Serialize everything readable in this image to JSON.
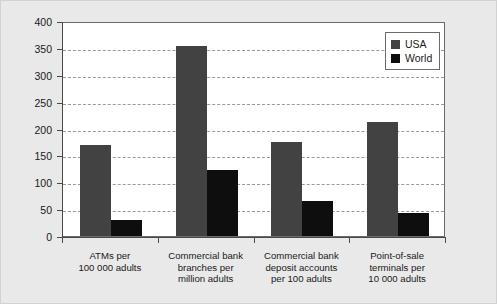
{
  "chart_data": {
    "type": "bar",
    "title": "",
    "subtitle": "",
    "xlabel": "",
    "ylabel": "",
    "ylim": [
      0,
      400
    ],
    "ytick_step": 50,
    "yticks": [
      "400",
      "350",
      "300",
      "250",
      "200",
      "150",
      "100",
      "50",
      "0"
    ],
    "grid": true,
    "grid_style": "dashed-horizontal",
    "legend_position": "top-right-inside",
    "categories": [
      "ATMs per\n100 000 adults",
      "Commercial bank\nbranches per\nmillion adults",
      "Commercial bank\ndeposit accounts\nper 100 adults",
      "Point-of-sale\nterminals per\n10 000 adults"
    ],
    "category_lines": [
      [
        "ATMs per",
        "100 000 adults"
      ],
      [
        "Commercial bank",
        "branches per",
        "million adults"
      ],
      [
        "Commercial bank",
        "deposit accounts",
        "per 100 adults"
      ],
      [
        "Point-of-sale",
        "terminals per",
        "10 000 adults"
      ]
    ],
    "series": [
      {
        "name": "USA",
        "color": "#424242",
        "values": [
          170,
          353,
          175,
          212
        ]
      },
      {
        "name": "World",
        "color": "#0e0e0e",
        "values": [
          30,
          123,
          65,
          42
        ]
      }
    ]
  },
  "legend": {
    "items": [
      {
        "label": "USA",
        "swatch": "#424242"
      },
      {
        "label": "World",
        "swatch": "#0e0e0e"
      }
    ]
  },
  "colors": {
    "figure_background": "#e9e9e9",
    "plot_background": "#ffffff",
    "axis": "#4a4a4a",
    "gridline": "#9a9a9a",
    "text": "#1a1a1a",
    "usa": "#424242",
    "world": "#0e0e0e"
  }
}
